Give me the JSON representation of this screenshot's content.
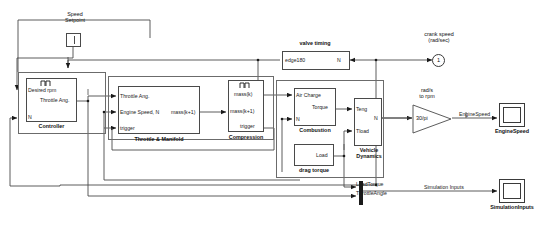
{
  "diagram": {
    "type": "simulink-block-diagram"
  },
  "sources": {
    "speed_setpoint": {
      "label_line1": "Speed",
      "label_line2": "Setpoint",
      "icon": "step-source-icon"
    },
    "drag_torque": {
      "name": "drag torque",
      "out_port": "Load"
    },
    "valve_timing": {
      "name": "valve timing",
      "out_port": "edge180",
      "in_port": "N"
    }
  },
  "subsystems": {
    "controller": {
      "name": "Controller",
      "in_ports": [
        "Desired rpm",
        "N"
      ],
      "out_ports": [
        "Throttle Ang."
      ],
      "triggered": true
    },
    "throttle_manifold": {
      "name": "Throttle & Manifold",
      "in_ports": [
        "Throttle Ang.",
        "Engine Speed, N",
        "trigger"
      ],
      "out_ports": [
        "mass(k+1)"
      ],
      "triggered": false
    },
    "compression": {
      "name": "Compression",
      "in_ports": [
        "mass(k+1)",
        "trigger"
      ],
      "out_ports": [
        "mass(k)"
      ],
      "triggered": true
    },
    "combustion": {
      "name": "Combustion",
      "in_ports": [
        "Air Charge",
        "N"
      ],
      "out_ports": [
        "Torque"
      ],
      "triggered": false
    },
    "vehicle_dynamics": {
      "name_line1": "Vehicle",
      "name_line2": "Dynamics",
      "in_ports": [
        "Teng",
        "Tload"
      ],
      "out_ports": [
        "N"
      ],
      "triggered": false
    }
  },
  "gain": {
    "value": "30/pi",
    "caption_line1": "rad/s",
    "caption_line2": "to rpm"
  },
  "outport": {
    "number": "1",
    "caption_line1": "crank speed",
    "caption_line2": "(rad/sec)"
  },
  "scopes": {
    "engine_speed": {
      "name": "EngineSpeed",
      "input_signal": "EngineSpeed"
    },
    "simulation_inputs": {
      "name": "SimulationInputs",
      "input_signal": "Simulation Inputs"
    }
  },
  "signal_labels": {
    "load_torque": "LoadTorque",
    "throttle_angle": "ThrottleAngle"
  },
  "colors": {
    "line": "#4a4a4a",
    "text": "#111111",
    "background": "#ffffff",
    "mux": "#1a1a1a"
  }
}
